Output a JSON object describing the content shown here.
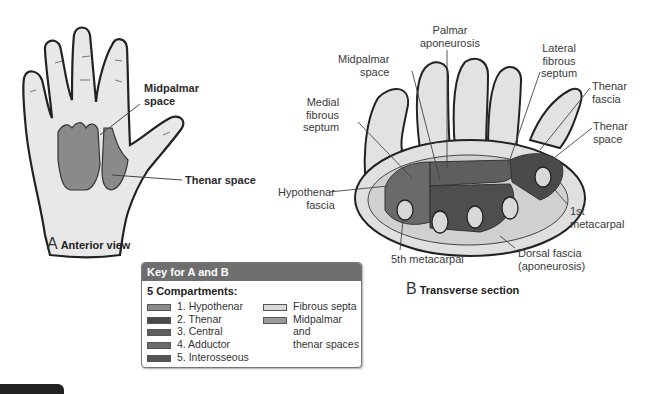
{
  "figure": {
    "panel_a": {
      "letter": "A",
      "caption": "Anterior view",
      "labels": {
        "midpalmar_space": [
          "Midpalmar",
          "space"
        ],
        "thenar_space": "Thenar space"
      }
    },
    "panel_b": {
      "letter": "B",
      "caption": "Transverse section",
      "labels": {
        "palmar_aponeurosis": [
          "Palmar",
          "aponeurosis"
        ],
        "midpalmar_space": [
          "Midpalmar",
          "space"
        ],
        "lateral_fibrous_septum": [
          "Lateral",
          "fibrous",
          "septum"
        ],
        "medial_fibrous_septum": [
          "Medial",
          "fibrous",
          "septum"
        ],
        "thenar_fascia": [
          "Thenar",
          "fascia"
        ],
        "thenar_space": [
          "Thenar",
          "space"
        ],
        "hypothenar_fascia": [
          "Hypothenar",
          "fascia"
        ],
        "first_metacarpal": [
          "1st",
          "metacarpal"
        ],
        "fifth_metacarpal": "5th metacarpal",
        "dorsal_fascia": [
          "Dorsal fascia",
          "(aponeurosis)"
        ]
      }
    },
    "key": {
      "title": "Key for A and B",
      "subtitle": "5 Compartments:",
      "compartments": [
        {
          "label": "1. Hypothenar",
          "color": "#8a8a8a"
        },
        {
          "label": "2. Thenar",
          "color": "#4a4a4a"
        },
        {
          "label": "3. Central",
          "color": "#5e5e5e"
        },
        {
          "label": "4. Adductor",
          "color": "#6a6a6a"
        },
        {
          "label": "5. Interosseous",
          "color": "#555555"
        }
      ],
      "other": [
        {
          "label": "Fibrous septa",
          "color": "#d8d8d8"
        },
        {
          "label": "Midpalmar and",
          "label2": "thenar spaces",
          "color": "#9a9a9a"
        }
      ]
    }
  }
}
